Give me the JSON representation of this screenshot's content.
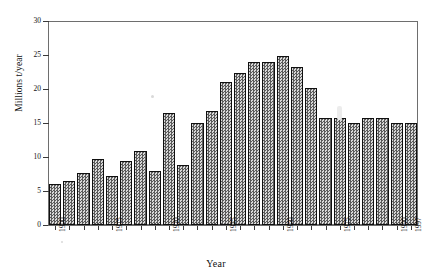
{
  "chart_data": {
    "type": "bar",
    "title": "",
    "subtitle": "",
    "xlabel": "Year",
    "ylabel": "Millions t/year",
    "ylim": [
      0,
      30
    ],
    "yticks": [
      0,
      5,
      10,
      15,
      20,
      25,
      30
    ],
    "ytick_labels": [
      "0",
      "5",
      "10",
      "15",
      "20",
      "25",
      "30"
    ],
    "xtick_labels": [
      "1900",
      "1915",
      "1930",
      "1945",
      "1960",
      "1975",
      "1990",
      "1997"
    ],
    "xtick_bar_index": [
      0,
      4,
      8,
      12,
      16,
      20,
      24,
      25
    ],
    "grid": false,
    "legend": null,
    "bar_style": {
      "fill": "#9a9a9a",
      "pattern": "checkerboard-hatch",
      "edge": "#101010"
    },
    "categories": [
      "1900",
      "1904",
      "1908",
      "1912",
      "1915",
      "1919",
      "1923",
      "1927",
      "1930",
      "1934",
      "1938",
      "1942",
      "1945",
      "1949",
      "1953",
      "1957",
      "1960",
      "1964",
      "1968",
      "1972",
      "1975",
      "1979",
      "1983",
      "1987",
      "1990",
      "1997"
    ],
    "values": [
      6.0,
      6.5,
      7.7,
      9.7,
      7.2,
      9.4,
      10.9,
      7.9,
      16.4,
      8.8,
      15.0,
      16.7,
      21.0,
      22.4,
      23.9,
      23.9,
      24.8,
      23.2,
      20.2,
      15.8,
      15.7,
      15.0,
      0,
      0,
      0,
      0
    ],
    "bars": [
      {
        "label": "1900",
        "value": 6.0
      },
      {
        "label": "1904",
        "value": 6.5
      },
      {
        "label": "1908",
        "value": 7.7
      },
      {
        "label": "1912",
        "value": 9.7
      },
      {
        "label": "1915",
        "value": 7.2
      },
      {
        "label": "1919",
        "value": 9.4
      },
      {
        "label": "1923",
        "value": 10.9
      },
      {
        "label": "1927",
        "value": 7.9
      },
      {
        "label": "1930",
        "value": 16.4
      },
      {
        "label": "1934",
        "value": 8.8
      },
      {
        "label": "1938",
        "value": 15.0
      },
      {
        "label": "1942",
        "value": 16.7
      },
      {
        "label": "1945",
        "value": 21.0
      },
      {
        "label": "1949",
        "value": 22.4
      },
      {
        "label": "1953",
        "value": 23.9
      },
      {
        "label": "1957",
        "value": 23.9
      },
      {
        "label": "1960",
        "value": 24.8
      },
      {
        "label": "1964",
        "value": 23.2
      },
      {
        "label": "1968",
        "value": 20.2
      },
      {
        "label": "1972",
        "value": 15.8
      },
      {
        "label": "1975",
        "value": 15.7
      },
      {
        "label": "1979",
        "value": 15.0
      },
      {
        "label": "1983",
        "value": 15.8
      },
      {
        "label": "1987",
        "value": 15.7
      },
      {
        "label": "1990",
        "value": 15.0
      },
      {
        "label": "1997",
        "value": 15.0
      }
    ]
  },
  "axes": {
    "y": {
      "title": "Millions t/year",
      "ticks": [
        {
          "value": 30,
          "label": "30"
        },
        {
          "value": 25,
          "label": "25"
        },
        {
          "value": 20,
          "label": "20"
        },
        {
          "value": 15,
          "label": "15"
        },
        {
          "value": 10,
          "label": "10"
        },
        {
          "value": 5,
          "label": "5"
        },
        {
          "value": 0,
          "label": "0"
        }
      ]
    },
    "x": {
      "title": "Year",
      "ticks": [
        {
          "bar_index": 0,
          "label": "1900"
        },
        {
          "bar_index": 4,
          "label": "1915"
        },
        {
          "bar_index": 8,
          "label": "1930"
        },
        {
          "bar_index": 12,
          "label": "1945"
        },
        {
          "bar_index": 16,
          "label": "1960"
        },
        {
          "bar_index": 20,
          "label": "1975"
        },
        {
          "bar_index": 24,
          "label": "1990"
        },
        {
          "bar_index": 25,
          "label": "1997"
        }
      ]
    }
  }
}
